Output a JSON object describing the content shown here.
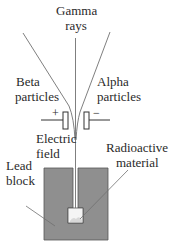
{
  "labels": {
    "gamma": [
      "Gamma",
      "rays"
    ],
    "beta": [
      "Beta",
      "particles"
    ],
    "alpha": [
      "Alpha",
      "particles"
    ],
    "electric_field": [
      "Electric",
      "field"
    ],
    "radioactive": [
      "Radioactive",
      "material"
    ],
    "lead_block": [
      "Lead",
      "block"
    ],
    "plus": "+",
    "minus": "−"
  },
  "colors": {
    "lead_block": "#8f8f8f",
    "lines": "#707070",
    "text": "#2a2a2a"
  }
}
